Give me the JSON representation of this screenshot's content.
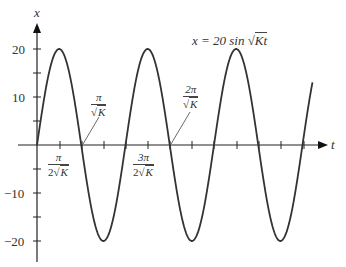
{
  "chart_data": {
    "type": "line",
    "title": "",
    "annotation": "x = 20 sin √K t",
    "xlabel": "t",
    "ylabel": "x",
    "yticks": [
      -20,
      -10,
      10,
      20
    ],
    "ylim": [
      -24,
      24
    ],
    "x_unit": "π/(2√K)",
    "x_tick_labels": [
      {
        "num": "π",
        "den": "2√K",
        "at_quarter_periods": 1
      },
      {
        "num": "3π",
        "den": "2√K",
        "at_quarter_periods": 3
      }
    ],
    "callouts": [
      {
        "num": "π",
        "den": "√K",
        "at_quarter_periods": 2
      },
      {
        "num": "2π",
        "den": "√K",
        "at_quarter_periods": 4
      }
    ],
    "series": [
      {
        "name": "x = 20 sin √K t",
        "amplitude": 20,
        "periods_shown": 3.25,
        "color": "#333333"
      }
    ],
    "grid": false,
    "legend": "none"
  },
  "labels": {
    "y_axis": "x",
    "t_axis": "t",
    "equation_lhs": "x = 20 sin ",
    "equation_rad": "Kt",
    "y20": "20",
    "y10": "10",
    "yn10": "−10",
    "yn20": "−20",
    "tick1_num": "π",
    "tick1_den_coef": "2",
    "tick1_den_rad": "K",
    "tick3_num": "3π",
    "tick3_den_coef": "2",
    "tick3_den_rad": "K",
    "call1_num": "π",
    "call1_den_rad": "K",
    "call2_num": "2π",
    "call2_den_rad": "K"
  }
}
